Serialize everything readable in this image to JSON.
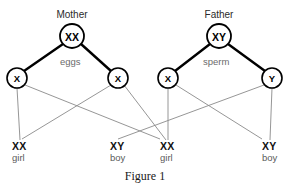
{
  "figure": {
    "caption": "Figure 1",
    "background_color": "#ffffff",
    "stroke_color": "#000000",
    "thin_line_color": "#8a8a8a",
    "gamete_text_color": "#6b6b6b"
  },
  "parents": [
    {
      "name": "mother",
      "label": "Mother",
      "genotype": "XX",
      "gamete_label": "eggs",
      "cx": 72,
      "cy": 36,
      "r": 12,
      "label_x": 72,
      "label_y": 9,
      "gamete_x": 60,
      "gamete_y": 56
    },
    {
      "name": "father",
      "label": "Father",
      "genotype": "XY",
      "gamete_label": "sperm",
      "cx": 219,
      "cy": 36,
      "r": 12,
      "label_x": 219,
      "label_y": 9,
      "gamete_x": 203,
      "gamete_y": 56
    }
  ],
  "gametes": [
    {
      "name": "gamete-mother-x1",
      "allele": "X",
      "parent": "mother",
      "cx": 17,
      "cy": 78,
      "r": 10
    },
    {
      "name": "gamete-mother-x2",
      "allele": "X",
      "parent": "mother",
      "cx": 118,
      "cy": 78,
      "r": 10
    },
    {
      "name": "gamete-father-x",
      "allele": "X",
      "parent": "father",
      "cx": 168,
      "cy": 78,
      "r": 10
    },
    {
      "name": "gamete-father-y",
      "allele": "Y",
      "parent": "father",
      "cx": 272,
      "cy": 78,
      "r": 10
    }
  ],
  "offspring": [
    {
      "name": "offspring-1",
      "genotype": "XX",
      "sex": "girl",
      "x": 12,
      "y": 142,
      "anchor_x": 20
    },
    {
      "name": "offspring-2",
      "genotype": "XY",
      "sex": "boy",
      "x": 110,
      "y": 142,
      "anchor_x": 118
    },
    {
      "name": "offspring-3",
      "genotype": "XX",
      "sex": "girl",
      "x": 160,
      "y": 142,
      "anchor_x": 168
    },
    {
      "name": "offspring-4",
      "genotype": "XY",
      "sex": "boy",
      "x": 262,
      "y": 142,
      "anchor_x": 270
    }
  ],
  "parent_edges": [
    {
      "name": "edge-mother-to-x1",
      "x1": 63,
      "y1": 44,
      "x2": 24,
      "y2": 71
    },
    {
      "name": "edge-mother-to-x2",
      "x1": 81,
      "y1": 44,
      "x2": 111,
      "y2": 71
    },
    {
      "name": "edge-father-to-x",
      "x1": 210,
      "y1": 44,
      "x2": 175,
      "y2": 71
    },
    {
      "name": "edge-father-to-y",
      "x1": 228,
      "y1": 44,
      "x2": 265,
      "y2": 71
    }
  ],
  "fertilization_edges": [
    {
      "name": "edge-x1-to-offspring1",
      "x1": 17,
      "y1": 88,
      "x2": 20,
      "y2": 140
    },
    {
      "name": "edge-x1-to-offspring2",
      "x1": 25,
      "y1": 85,
      "x2": 160,
      "y2": 139
    },
    {
      "name": "edge-x2-to-offspring3",
      "x1": 124,
      "y1": 85,
      "x2": 166,
      "y2": 140
    },
    {
      "name": "edge-x2-to-offspring1",
      "x1": 111,
      "y1": 85,
      "x2": 22,
      "y2": 139
    },
    {
      "name": "edge-fx-to-offspring3",
      "x1": 168,
      "y1": 88,
      "x2": 168,
      "y2": 140
    },
    {
      "name": "edge-fx-to-offspring4",
      "x1": 176,
      "y1": 85,
      "x2": 262,
      "y2": 139
    },
    {
      "name": "edge-fy-to-offspring4",
      "x1": 272,
      "y1": 88,
      "x2": 270,
      "y2": 140
    },
    {
      "name": "edge-fy-to-offspring2",
      "x1": 264,
      "y1": 85,
      "x2": 118,
      "y2": 139
    }
  ]
}
